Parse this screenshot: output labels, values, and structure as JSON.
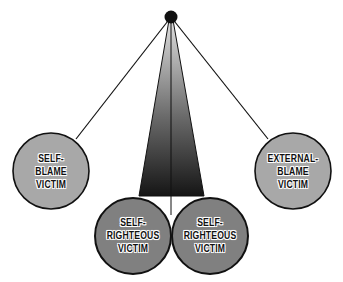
{
  "diagram": {
    "type": "pendulum",
    "pivot": {
      "x": 171,
      "y": 17,
      "r": 6
    },
    "colors": {
      "outer_circle": "#a8a8a8",
      "inner_circle": "#7f7f7f",
      "stroke": "#111111",
      "fan_top": "#d8d8d8",
      "fan_bottom": "#1a1a1a"
    },
    "nodes": [
      {
        "id": "self-blame",
        "lines": [
          "SELF-",
          "BLAME",
          "VICTIM"
        ],
        "cx": 51,
        "cy": 171,
        "r": 38
      },
      {
        "id": "self-righteous-left",
        "lines": [
          "SELF-",
          "RIGHTEOUS",
          "VICTIM"
        ],
        "cx": 133,
        "cy": 236,
        "r": 38
      },
      {
        "id": "self-righteous-right",
        "lines": [
          "SELF-",
          "RIGHTEOUS",
          "VICTIM"
        ],
        "cx": 210,
        "cy": 236,
        "r": 38
      },
      {
        "id": "external-blame",
        "lines": [
          "EXTERNAL-",
          "BLAME",
          "VICTIM"
        ],
        "cx": 293,
        "cy": 171,
        "r": 38
      }
    ]
  }
}
